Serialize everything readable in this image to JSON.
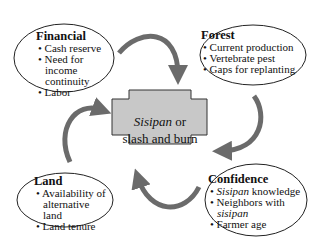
{
  "diagram": {
    "center": {
      "line1_italic": "Sisipan",
      "line1_rest": " or",
      "line2": "slash and burn",
      "fill": "#c8c8c8"
    },
    "nodes": {
      "financial": {
        "title": "Financial",
        "items": [
          "Cash reserve",
          "Need for income continuity",
          "Labor"
        ]
      },
      "forest": {
        "title": "Forest",
        "items": [
          "Current production",
          "Vertebrate pest",
          "Gaps for replanting"
        ]
      },
      "land": {
        "title": "Land",
        "items": [
          "Availability of alternative land",
          "Land tenure"
        ]
      },
      "confidence": {
        "title": "Confidence",
        "item1_italic": "Sisipan",
        "item1_rest": " knowledge",
        "item2": "Neighbors with",
        "item2_italic": "sisipan",
        "item3": "Farmer age"
      }
    },
    "bullet": "•",
    "arrow_color": "#666666"
  }
}
